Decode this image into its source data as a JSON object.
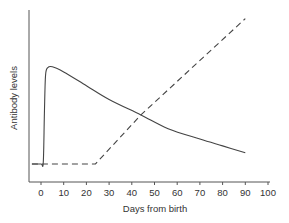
{
  "chart_data": {
    "type": "line",
    "title": "",
    "xlabel": "Days from birth",
    "ylabel": "Antibody levels",
    "xlim": [
      -5,
      100
    ],
    "ylim": [
      0,
      100
    ],
    "grid": false,
    "legend": null,
    "x_ticks": [
      0,
      10,
      20,
      30,
      40,
      50,
      60,
      70,
      80,
      90,
      100
    ],
    "y_ticks": [],
    "series": [
      {
        "name": "solid-curve",
        "style": "solid",
        "color": "#444444",
        "x": [
          -4,
          0,
          1,
          1.5,
          2,
          3,
          5,
          10,
          20,
          30,
          44,
          56,
          70,
          80,
          90
        ],
        "y": [
          10.5,
          10.5,
          11.5,
          40,
          62,
          66.5,
          67,
          64,
          56,
          48,
          39,
          31,
          25,
          21,
          17
        ]
      },
      {
        "name": "dashed-curve",
        "style": "dashed",
        "color": "#444444",
        "x": [
          -4,
          24,
          44,
          90
        ],
        "y": [
          10.5,
          10.5,
          39,
          95
        ]
      }
    ]
  },
  "axes": {
    "x_label": "Days from birth",
    "y_label": "Antibody levels",
    "x_tick_labels": [
      "0",
      "10",
      "20",
      "30",
      "40",
      "50",
      "60",
      "70",
      "80",
      "90",
      "100"
    ]
  }
}
